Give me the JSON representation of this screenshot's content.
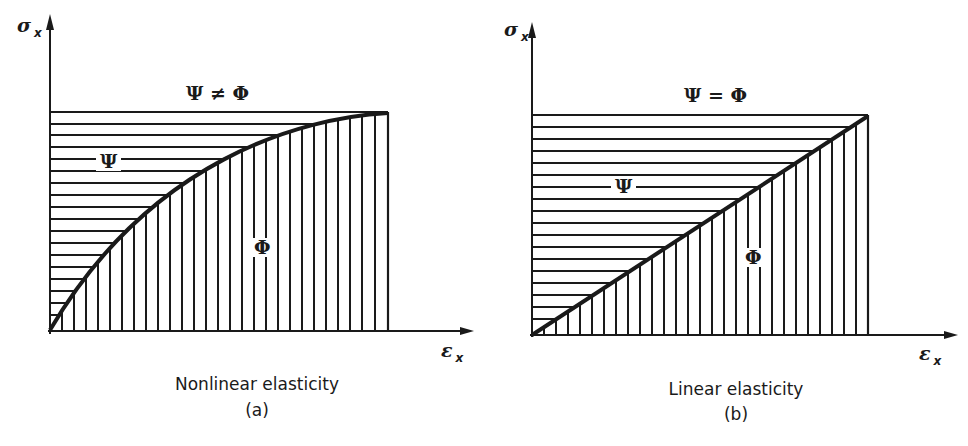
{
  "figure": {
    "panels": [
      {
        "id": "a",
        "caption": "Nonlinear elasticity",
        "label": "(a)",
        "y_axis": "σ",
        "y_axis_sub": "x",
        "x_axis": "ε",
        "x_axis_sub": "x",
        "relation": "Ψ ≠ Φ",
        "upper_region": "Ψ",
        "lower_region": "Φ",
        "curve": "nonlinear concave stress-strain curve"
      },
      {
        "id": "b",
        "caption": "Linear elasticity",
        "label": "(b)",
        "y_axis": "σ",
        "y_axis_sub": "x",
        "x_axis": "ε",
        "x_axis_sub": "x",
        "relation": "Ψ = Φ",
        "upper_region": "Ψ",
        "lower_region": "Φ",
        "curve": "straight line stress-strain"
      }
    ]
  },
  "colors": {
    "ink": "#1a1a1a",
    "background": "#ffffff"
  }
}
